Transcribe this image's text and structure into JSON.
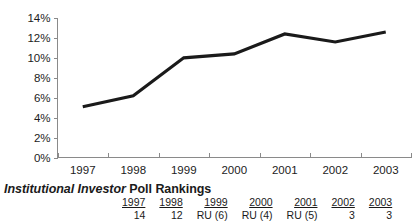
{
  "chart_data": {
    "type": "line",
    "title": "",
    "xlabel": "",
    "ylabel": "",
    "x": [
      "1997",
      "1998",
      "1999",
      "2000",
      "2001",
      "2002",
      "2003"
    ],
    "categories": [
      "1997",
      "1998",
      "1999",
      "2000",
      "2001",
      "2002",
      "2003"
    ],
    "values": [
      5.1,
      6.2,
      10.0,
      10.4,
      12.4,
      11.6,
      12.6
    ],
    "series": [
      {
        "name": "",
        "values": [
          5.1,
          6.2,
          10.0,
          10.4,
          12.4,
          11.6,
          12.6
        ]
      }
    ],
    "ylim": [
      0,
      14
    ],
    "yticks": [
      0,
      2,
      4,
      6,
      8,
      10,
      12,
      14
    ],
    "ytick_labels": [
      "0%",
      "2%",
      "4%",
      "6%",
      "8%",
      "10%",
      "12%",
      "14%"
    ],
    "xtick_labels": [
      "1997",
      "1998",
      "1999",
      "2000",
      "2001",
      "2002",
      "2003"
    ],
    "grid": false,
    "legend": false,
    "line_color": "#1a1a1a",
    "axis_color": "#8a8a8a"
  },
  "rankings": {
    "title_italic": "Institutional Investor",
    "title_plain": " Poll Rankings",
    "columns": [
      {
        "year": "1997",
        "value": "14"
      },
      {
        "year": "1998",
        "value": "12"
      },
      {
        "year": "1999",
        "value": "RU (6)"
      },
      {
        "year": "2000",
        "value": "RU (4)"
      },
      {
        "year": "2001",
        "value": "RU (5)"
      },
      {
        "year": "2002",
        "value": "3"
      },
      {
        "year": "2003",
        "value": "3"
      }
    ]
  }
}
